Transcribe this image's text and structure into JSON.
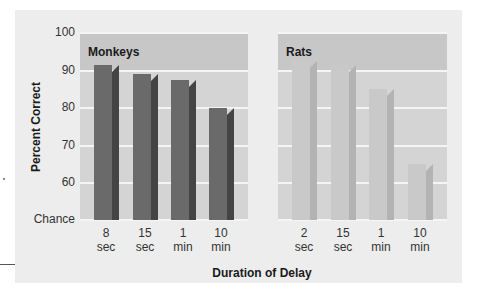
{
  "chart_data": {
    "type": "bar",
    "title": "",
    "xlabel": "Duration of Delay",
    "ylabel": "Percent Correct",
    "ylim": [
      50,
      100
    ],
    "y_ticks": [
      "Chance",
      "60",
      "70",
      "80",
      "90",
      "100"
    ],
    "y_tick_values": [
      50,
      60,
      70,
      80,
      90,
      100
    ],
    "grid": true,
    "panels": [
      {
        "name": "Monkeys",
        "categories": [
          "8 sec",
          "15 sec",
          "1 min",
          "10 min"
        ],
        "values": [
          91.5,
          89,
          87.5,
          80
        ],
        "color_front": "#6a6a6a",
        "color_side": "#444444"
      },
      {
        "name": "Rats",
        "categories": [
          "2 sec",
          "15 sec",
          "1 min",
          "10 min"
        ],
        "values": [
          92.5,
          91.5,
          85,
          65
        ],
        "color_front": "#c9c9c9",
        "color_side": "#b3b3b3"
      }
    ]
  },
  "labels": {
    "ylabel": "Percent Correct",
    "xlabel": "Duration of Delay",
    "yticks": [
      "100",
      "90",
      "80",
      "70",
      "60",
      "Chance"
    ],
    "monkeys_title": "Monkeys",
    "rats_title": "Rats",
    "monkeys_x": [
      [
        "8",
        "sec"
      ],
      [
        "15",
        "sec"
      ],
      [
        "1",
        "min"
      ],
      [
        "10",
        "min"
      ]
    ],
    "rats_x": [
      [
        "2",
        "sec"
      ],
      [
        "15",
        "sec"
      ],
      [
        "1",
        "min"
      ],
      [
        "10",
        "min"
      ]
    ]
  }
}
